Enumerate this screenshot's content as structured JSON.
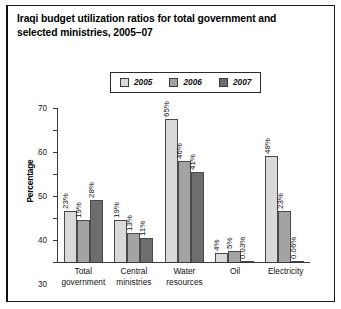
{
  "figure": {
    "title": "Iraqi budget utilization ratios for total government and selected ministries, 2005–07"
  },
  "chart_data": {
    "type": "bar",
    "title": "Iraqi budget utilization ratios for total government and selected ministries, 2005–07",
    "xlabel": "",
    "ylabel": "Percentage",
    "ylim": [
      0,
      70
    ],
    "yticks": [
      0,
      10,
      20,
      30,
      40,
      50,
      60,
      70
    ],
    "ytick_labels": [
      "0",
      "10",
      "20",
      "30",
      "40",
      "50",
      "60",
      "70"
    ],
    "grid": false,
    "legend_position": "top-center",
    "categories": [
      "Total government",
      "Central ministries",
      "Water resources",
      "Oil",
      "Electricity"
    ],
    "category_lines": [
      [
        "Total",
        "government"
      ],
      [
        "Central",
        "ministries"
      ],
      [
        "Water",
        "resources"
      ],
      [
        "Oil",
        ""
      ],
      [
        "Electricity",
        ""
      ]
    ],
    "series": [
      {
        "name": "2005",
        "color": "#d9d9d9",
        "values": [
          23,
          19,
          65,
          4,
          48
        ],
        "labels": [
          "23%",
          "19%",
          "65%",
          "4%",
          "48%"
        ]
      },
      {
        "name": "2006",
        "color": "#a3a3a3",
        "values": [
          19,
          13,
          46,
          5,
          23
        ],
        "labels": [
          "19%",
          "13%",
          "46%",
          "5%",
          "23%"
        ]
      },
      {
        "name": "2007",
        "color": "#6e6e6e",
        "values": [
          28,
          11,
          41,
          0.03,
          0.06
        ],
        "labels": [
          "28%",
          "11%",
          "41%",
          "0.03%",
          "0.06%"
        ]
      }
    ],
    "series_by_category": [
      {
        "category": "Total government",
        "2005": 23,
        "2006": 19,
        "2007": 28
      },
      {
        "category": "Central ministries",
        "2005": 14,
        "2006": 13,
        "2007": 11
      },
      {
        "category": "Water resources",
        "2005": 65,
        "2006": 46,
        "2007": 41
      },
      {
        "category": "Oil",
        "2005": 4,
        "2006": 5,
        "2007": 0.03
      },
      {
        "category": "Electricity",
        "2005": 48,
        "2006": 23,
        "2007": 0.06
      }
    ],
    "bars": [
      {
        "group": 0,
        "series": 0,
        "value": 23,
        "label": "23%",
        "color": "#d9d9d9"
      },
      {
        "group": 0,
        "series": 1,
        "value": 19,
        "label": "19%",
        "color": "#a3a3a3"
      },
      {
        "group": 0,
        "series": 2,
        "value": 28,
        "label": "28%",
        "color": "#6e6e6e"
      },
      {
        "group": 1,
        "series": 0,
        "value": 14,
        "label": "14%",
        "color": "#d9d9d9"
      },
      {
        "group": 1,
        "series": 1,
        "value": 13,
        "label": "13%",
        "color": "#a3a3a3"
      },
      {
        "group": 1,
        "series": 2,
        "value": 11,
        "label": "11%",
        "color": "#6e6e6e"
      },
      {
        "group": 2,
        "series": 0,
        "value": 65,
        "label": "65%",
        "color": "#d9d9d9"
      },
      {
        "group": 2,
        "series": 1,
        "value": 46,
        "label": "46%",
        "color": "#a3a3a3"
      },
      {
        "group": 2,
        "series": 2,
        "value": 41,
        "label": "41%",
        "color": "#6e6e6e"
      },
      {
        "group": 3,
        "series": 0,
        "value": 4,
        "label": "4%",
        "color": "#d9d9d9"
      },
      {
        "group": 3,
        "series": 1,
        "value": 5,
        "label": "5%",
        "color": "#a3a3a3"
      },
      {
        "group": 3,
        "series": 2,
        "value": 0.03,
        "label": "0.03%",
        "color": "#6e6e6e"
      },
      {
        "group": 4,
        "series": 0,
        "value": 48,
        "label": "48%",
        "color": "#d9d9d9"
      },
      {
        "group": 4,
        "series": 1,
        "value": 23,
        "label": "23%",
        "color": "#a3a3a3"
      },
      {
        "group": 4,
        "series": 2,
        "value": 0.06,
        "label": "0.06%",
        "color": "#6e6e6e"
      }
    ]
  }
}
